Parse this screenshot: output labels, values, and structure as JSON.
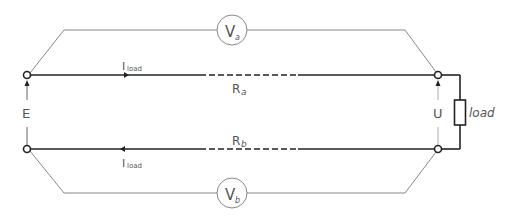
{
  "diagram": {
    "type": "four-wire voltage drop measurement circuit",
    "colors": {
      "main_wire": "#222222",
      "meter_wire": "#888888",
      "label": "#555555",
      "background": "#ffffff"
    },
    "source": {
      "label": "E"
    },
    "load_voltage": {
      "label": "U"
    },
    "load": {
      "label": "load"
    },
    "line_a": {
      "resistance_label": "R",
      "resistance_sub": "a",
      "current_label": "I",
      "current_sub": "load"
    },
    "line_b": {
      "resistance_label": "R",
      "resistance_sub": "b",
      "current_label": "I",
      "current_sub": "load"
    },
    "voltmeter_a": {
      "label": "V",
      "sub": "a"
    },
    "voltmeter_b": {
      "label": "V",
      "sub": "b"
    }
  }
}
